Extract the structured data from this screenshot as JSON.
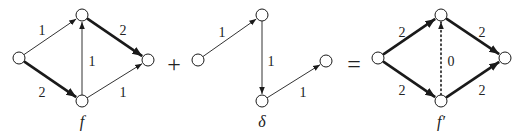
{
  "diagram": {
    "operators": [
      {
        "symbol": "+",
        "x": 174,
        "y": 66
      },
      {
        "symbol": "=",
        "x": 354,
        "y": 66
      }
    ],
    "graphs": [
      {
        "id": "f",
        "caption": "f",
        "caption_pos": [
          82,
          127
        ],
        "nodes": {
          "s": [
            19,
            58
          ],
          "a": [
            82,
            15
          ],
          "b": [
            82,
            101
          ],
          "t": [
            148,
            60
          ]
        },
        "edges": [
          {
            "from": "s",
            "to": "a",
            "label": "1",
            "style": "thin",
            "label_pos": [
              42,
              32
            ]
          },
          {
            "from": "a",
            "to": "t",
            "label": "2",
            "style": "thick",
            "label_pos": [
              123,
              32
            ]
          },
          {
            "from": "s",
            "to": "b",
            "label": "2",
            "style": "thick",
            "label_pos": [
              42,
              94
            ]
          },
          {
            "from": "b",
            "to": "t",
            "label": "1",
            "style": "thin",
            "label_pos": [
              123,
              94
            ]
          },
          {
            "from": "b",
            "to": "a",
            "label": "1",
            "style": "thin",
            "label_pos": [
              92,
              63
            ]
          }
        ]
      },
      {
        "id": "delta",
        "caption": "δ",
        "caption_pos": [
          262,
          127
        ],
        "nodes": {
          "s": [
            198,
            60
          ],
          "a": [
            262,
            15
          ],
          "b": [
            262,
            101
          ],
          "t": [
            326,
            61
          ]
        },
        "edges": [
          {
            "from": "s",
            "to": "a",
            "label": "1",
            "style": "thin",
            "label_pos": [
              222,
              34
            ]
          },
          {
            "from": "a",
            "to": "b",
            "label": "1",
            "style": "thin",
            "label_pos": [
              271,
              63
            ]
          },
          {
            "from": "b",
            "to": "t",
            "label": "1",
            "style": "thin",
            "label_pos": [
              303,
              94
            ]
          }
        ]
      },
      {
        "id": "f_prime",
        "caption": "f′",
        "caption_pos": [
          441,
          127
        ],
        "nodes": {
          "s": [
            378,
            58
          ],
          "a": [
            441,
            15
          ],
          "b": [
            441,
            101
          ],
          "t": [
            505,
            58
          ]
        },
        "edges": [
          {
            "from": "s",
            "to": "a",
            "label": "2",
            "style": "thick",
            "label_pos": [
              402,
              34
            ]
          },
          {
            "from": "a",
            "to": "t",
            "label": "2",
            "style": "thick",
            "label_pos": [
              482,
              34
            ]
          },
          {
            "from": "s",
            "to": "b",
            "label": "2",
            "style": "thick",
            "label_pos": [
              402,
              92
            ]
          },
          {
            "from": "b",
            "to": "t",
            "label": "2",
            "style": "thick",
            "label_pos": [
              482,
              92
            ]
          },
          {
            "from": "b",
            "to": "a",
            "label": "0",
            "style": "dotted",
            "label_pos": [
              451,
              63
            ]
          }
        ]
      }
    ],
    "colors": {
      "stroke": "#1a1a1a",
      "node_fill": "#ffffff",
      "thin_edge": "#333333"
    }
  }
}
